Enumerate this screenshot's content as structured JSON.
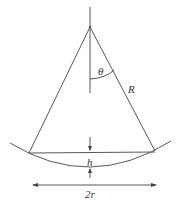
{
  "diagram": {
    "labels": {
      "theta": "θ",
      "radius": "R",
      "height": "h",
      "width": "2r"
    },
    "colors": {
      "stroke": "#444444",
      "text": "#333333"
    }
  }
}
